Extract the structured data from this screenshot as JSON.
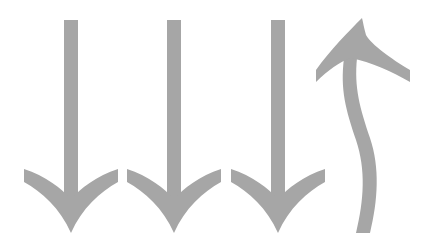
{
  "figure": {
    "color": "#a6a6a6",
    "background": "#ffffff",
    "arrows": [
      {
        "id": "arrow-1",
        "direction": "down",
        "shape": "straight"
      },
      {
        "id": "arrow-2",
        "direction": "down",
        "shape": "straight"
      },
      {
        "id": "arrow-3",
        "direction": "down",
        "shape": "straight"
      },
      {
        "id": "arrow-4",
        "direction": "up",
        "shape": "curved"
      }
    ]
  }
}
